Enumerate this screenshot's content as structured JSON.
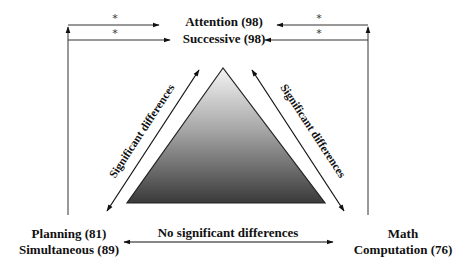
{
  "diagram": {
    "type": "triangle-comparison",
    "nodes": {
      "top": {
        "line1": "Attention (98)",
        "line2": "Successive (98)"
      },
      "bottom_left": {
        "line1": "Planning (81)",
        "line2": "Simultaneous (89)"
      },
      "bottom_right": {
        "line1": "Math",
        "line2": "Computation (76)"
      }
    },
    "edges": {
      "left_diagonal": "Significant differences",
      "right_diagonal": "Significant differences",
      "bottom": "No significant differences"
    },
    "significance_marker": "*",
    "markers": {
      "top_left_attention": "*",
      "top_left_successive": "*",
      "top_right_attention": "*",
      "top_right_successive": "*"
    },
    "colors": {
      "line": "#222222",
      "triangle_top": "#f2f2f2",
      "triangle_bottom": "#3a3a3a",
      "text": "#111111"
    }
  }
}
